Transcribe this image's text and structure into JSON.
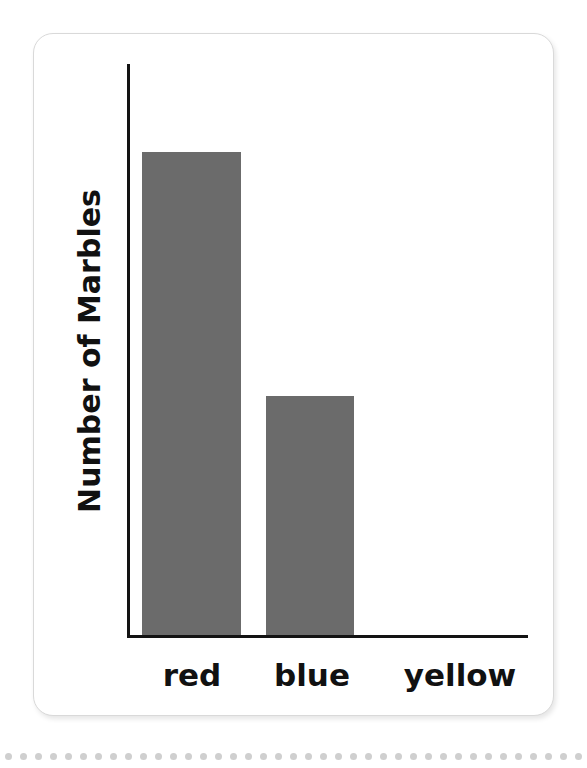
{
  "chart_data": {
    "type": "bar",
    "title": "",
    "xlabel": "",
    "ylabel": "Number of Marbles",
    "categories": [
      "red",
      "blue",
      "yellow"
    ],
    "values": [
      8,
      4,
      0
    ],
    "ylim": [
      0,
      9
    ],
    "grid": false,
    "legend": "none",
    "bar_color": "#6b6b6b",
    "axis_color": "#131313",
    "pixel_bar_heights": [
      483,
      239,
      0
    ]
  },
  "card": {
    "background": "#ffffff",
    "border_color": "#d9d9d9"
  },
  "decor": {
    "dot_color": "#cfcfcf",
    "dot_count": 42
  }
}
